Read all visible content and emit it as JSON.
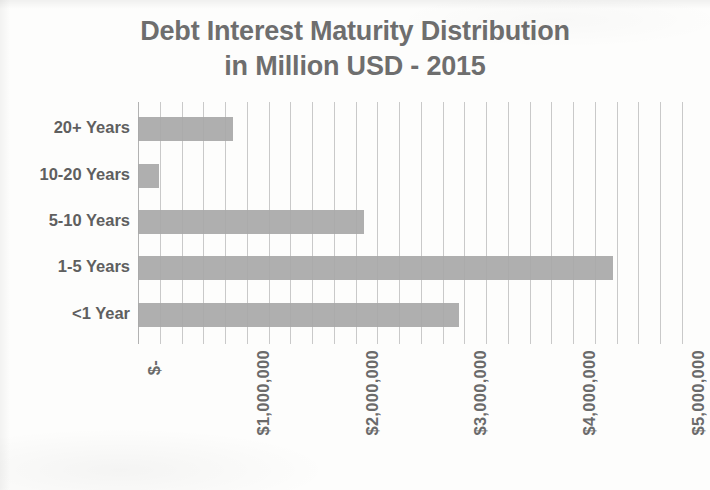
{
  "chart_data": {
    "type": "bar",
    "orientation": "horizontal",
    "title": "Debt Interest Maturity Distribution in Million USD - 2015",
    "title_lines": [
      "Debt Interest Maturity Distribution",
      "in Million USD - 2015"
    ],
    "categories": [
      "20+ Years",
      "10-20 Years",
      "5-10 Years",
      "1-5 Years",
      "<1 Year"
    ],
    "values": [
      873000,
      193000,
      2077000,
      4366000,
      2950000
    ],
    "series": [
      {
        "name": "Debt Interest",
        "values": [
          873000,
          193000,
          2077000,
          4366000,
          2950000
        ]
      }
    ],
    "xlabel": "",
    "ylabel": "",
    "xlim": [
      0,
      5000000
    ],
    "xticks": [
      0,
      1000000,
      2000000,
      3000000,
      4000000,
      5000000
    ],
    "xtick_labels": [
      "$-",
      "$1,000,000",
      "$2,000,000",
      "$3,000,000",
      "$4,000,000",
      "$5,000,000"
    ],
    "minor_tick_interval": 200000,
    "grid": true,
    "grid_axis": "x",
    "legend": false,
    "legend_position": "none",
    "bar_color": "#a8a8a8",
    "grid_color": "#c9c9c9",
    "text_color": "#6b6b6b",
    "background_color": "#fdfdfc"
  }
}
